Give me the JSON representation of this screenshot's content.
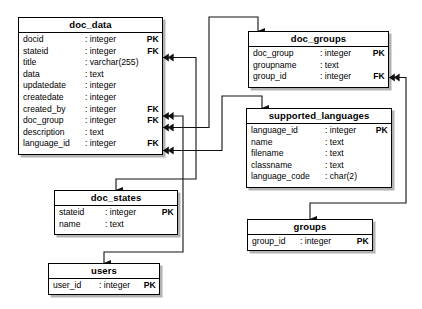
{
  "diagram": {
    "line_color": "#000000",
    "box_fill": "#ffffff",
    "text_color": "#000000"
  },
  "entities": [
    {
      "id": "doc_data",
      "name": "doc_data",
      "attributes": [
        {
          "name": "docid",
          "type": ": integer",
          "key": "PK"
        },
        {
          "name": "stateid",
          "type": ": integer",
          "key": "FK"
        },
        {
          "name": "title",
          "type": ": varchar(255)",
          "key": ""
        },
        {
          "name": "data",
          "type": ": text",
          "key": ""
        },
        {
          "name": "updatedate",
          "type": ": integer",
          "key": ""
        },
        {
          "name": "createdate",
          "type": ": integer",
          "key": ""
        },
        {
          "name": "created_by",
          "type": ": integer",
          "key": "FK"
        },
        {
          "name": "doc_group",
          "type": ": integer",
          "key": "FK"
        },
        {
          "name": "description",
          "type": ": text",
          "key": ""
        },
        {
          "name": "language_id",
          "type": ": integer",
          "key": "FK"
        }
      ]
    },
    {
      "id": "doc_groups",
      "name": "doc_groups",
      "attributes": [
        {
          "name": "doc_group",
          "type": ": integer",
          "key": "PK"
        },
        {
          "name": "groupname",
          "type": ": text",
          "key": ""
        },
        {
          "name": "group_id",
          "type": ": integer",
          "key": "FK"
        }
      ]
    },
    {
      "id": "supported_languages",
      "name": "supported_languages",
      "attributes": [
        {
          "name": "language_id",
          "type": ": integer",
          "key": "PK"
        },
        {
          "name": "name",
          "type": ": text",
          "key": ""
        },
        {
          "name": "filename",
          "type": ": text",
          "key": ""
        },
        {
          "name": "classname",
          "type": ": text",
          "key": ""
        },
        {
          "name": "language_code",
          "type": ": char(2)",
          "key": ""
        }
      ]
    },
    {
      "id": "doc_states",
      "name": "doc_states",
      "attributes": [
        {
          "name": "stateid",
          "type": ": integer",
          "key": "PK"
        },
        {
          "name": "name",
          "type": ": text",
          "key": ""
        }
      ]
    },
    {
      "id": "users",
      "name": "users",
      "attributes": [
        {
          "name": "user_id",
          "type": ": integer",
          "key": "PK"
        }
      ]
    },
    {
      "id": "groups",
      "name": "groups",
      "attributes": [
        {
          "name": "group_id",
          "type": ": integer",
          "key": "PK"
        }
      ]
    }
  ],
  "relationships": [
    {
      "from": "doc_data.stateid",
      "to": "doc_states.stateid"
    },
    {
      "from": "doc_data.created_by",
      "to": "users.user_id"
    },
    {
      "from": "doc_data.doc_group",
      "to": "doc_groups.doc_group"
    },
    {
      "from": "doc_data.language_id",
      "to": "supported_languages.language_id"
    },
    {
      "from": "doc_groups.group_id",
      "to": "groups.group_id"
    }
  ]
}
